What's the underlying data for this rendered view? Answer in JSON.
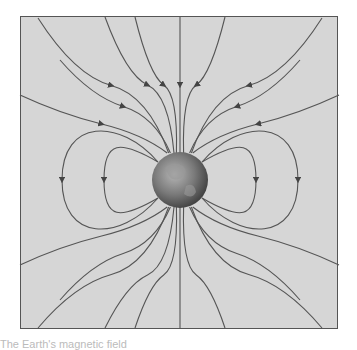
{
  "diagram": {
    "background_color": "#d6d6d6",
    "line_color": "#555555",
    "earth_label": "Earth",
    "field_lines": {
      "closed_loops_per_side": 2,
      "open_lines_top": 10,
      "open_lines_bottom": 10,
      "arrow_direction": "toward Earth"
    }
  },
  "caption": "The Earth's magnetic field"
}
